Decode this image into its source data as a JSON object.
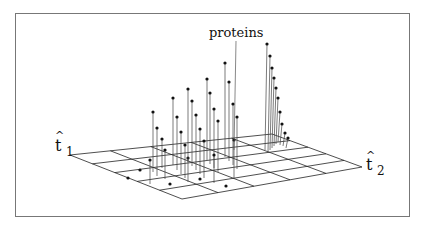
{
  "figure": {
    "annotation": "proteins",
    "axis_labels": {
      "t1": {
        "symbol": "t",
        "hat": "^",
        "subscript": "1"
      },
      "t2": {
        "symbol": "t",
        "hat": "^",
        "subscript": "2"
      }
    },
    "grid": {
      "divisions_u": 5,
      "divisions_v": 5
    },
    "colors": {
      "lines": "#222222",
      "frame": "#777777",
      "background": "#ffffff"
    }
  },
  "chart_data": {
    "type": "scatter",
    "title": "",
    "xlabel": "t̂1",
    "ylabel": "t̂2",
    "annotation": "proteins"
  }
}
